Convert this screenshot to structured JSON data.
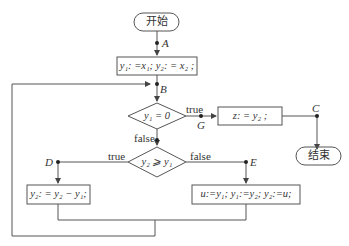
{
  "nodes": {
    "start": {
      "label": "开始"
    },
    "init": {
      "label": "y₁: =x₁; y₂: = x₂ ;"
    },
    "cond1": {
      "label": "y₁ = 0"
    },
    "assign_z": {
      "label": "z: = y₂ ;"
    },
    "end": {
      "label": "结束"
    },
    "cond2": {
      "label": "y₂ ⩾ y₁"
    },
    "subtract": {
      "label": "y₂: = y₂ − y₁;"
    },
    "swap": {
      "label": "u:=y₁; y₁:=y₂; y₂:=u;"
    }
  },
  "edge_labels": {
    "cond1_true": "true",
    "cond1_false": "false",
    "cond2_true": "true",
    "cond2_false": "false"
  },
  "points": {
    "A": "A",
    "B": "B",
    "C": "C",
    "D": "D",
    "E": "E",
    "G": "G"
  },
  "colors": {
    "stroke": "#555555",
    "text": "#333333"
  }
}
